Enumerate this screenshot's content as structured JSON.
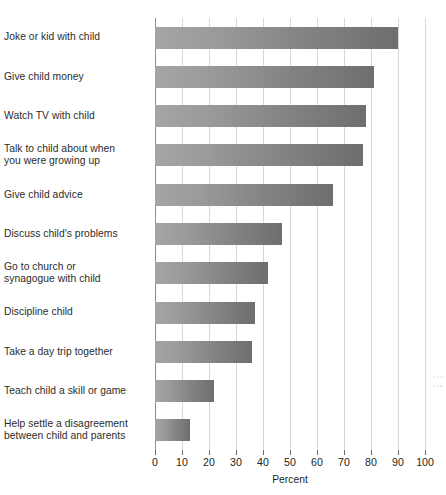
{
  "chart_data": {
    "type": "bar",
    "orientation": "horizontal",
    "title": "",
    "subtitle": "",
    "xlabel": "Percent",
    "ylabel": "",
    "xlim": [
      0,
      100
    ],
    "xticks": [
      0,
      10,
      20,
      30,
      40,
      50,
      60,
      70,
      80,
      90,
      100
    ],
    "xtick_labels": [
      "0",
      "10",
      "20",
      "30",
      "40",
      "50",
      "60",
      "70",
      "80",
      "90",
      "100"
    ],
    "grid": "vertical",
    "legend": null,
    "categories": [
      "Joke or kid with child",
      "Give child money",
      "Watch TV with child",
      "Talk to child about when\n you were growing up",
      "Give child advice",
      "Discuss child's problems",
      "Go to church or\nsynagogue with child",
      "Discipline child",
      "Take a day trip together",
      "Teach child a skill or game",
      "Help settle a disagreement\nbetween child and parents"
    ],
    "values": [
      90,
      81,
      78,
      77,
      66,
      47,
      42,
      37,
      36,
      22,
      13
    ],
    "bar_color_start": "#a5a5a5",
    "bar_color_end": "#6e6e6e",
    "gridline_color": "#d7d7d7",
    "axis_color": "#8c8c8c"
  },
  "scan_artifact": {
    "text": "e\ns\ne\ni\nc\ns\np"
  }
}
